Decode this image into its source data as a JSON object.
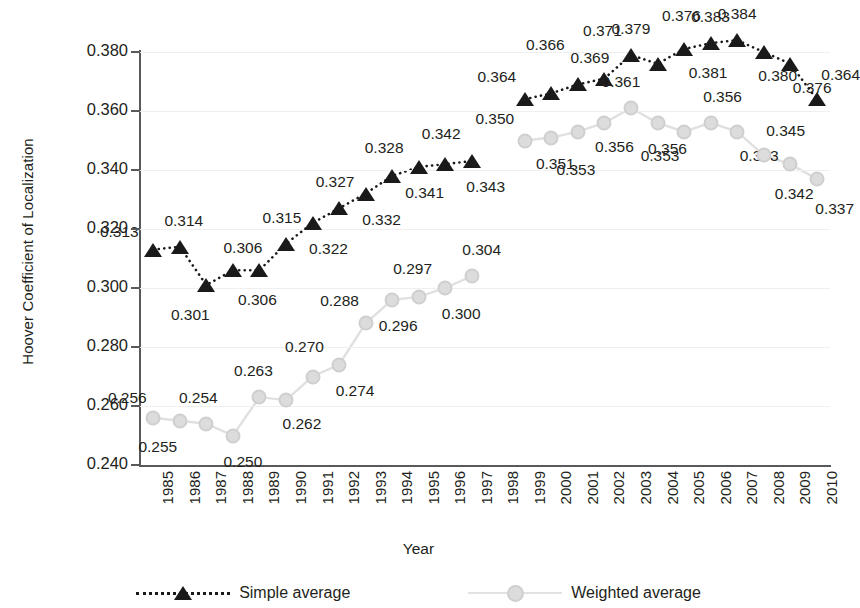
{
  "chart_data": {
    "type": "line",
    "title": "",
    "xlabel": "Year",
    "ylabel": "Hoover Coefficient of Localization",
    "ylim": [
      0.24,
      0.38
    ],
    "ytick_labels": [
      "0.380",
      "0.360",
      "0.340",
      "0.320",
      "0.300",
      "0.280",
      "0.260",
      "0.240"
    ],
    "ytick_values": [
      0.38,
      0.36,
      0.34,
      0.32,
      0.3,
      0.28,
      0.26,
      0.24
    ],
    "grid": true,
    "legend_position": "bottom",
    "categories": [
      "1985",
      "1986",
      "1987",
      "1988",
      "1989",
      "1990",
      "1991",
      "1992",
      "1993",
      "1994",
      "1995",
      "1996",
      "1997",
      "1998",
      "1999",
      "2000",
      "2001",
      "2002",
      "2003",
      "2004",
      "2005",
      "2006",
      "2007",
      "2008",
      "2009",
      "2010"
    ],
    "series": [
      {
        "name": "Simple average",
        "color": "#1a1a1a",
        "marker": "triangle",
        "linestyle": "dotted",
        "values": [
          0.313,
          0.314,
          0.301,
          0.306,
          0.306,
          0.315,
          0.322,
          0.327,
          0.332,
          0.338,
          0.341,
          0.342,
          0.343,
          null,
          0.364,
          0.366,
          0.369,
          0.371,
          0.379,
          0.376,
          0.381,
          0.383,
          0.384,
          0.38,
          0.376,
          0.364
        ],
        "point_labels": [
          "0.313",
          "0.314",
          "0.301",
          "0.306",
          "0.306",
          "0.315",
          "0.322",
          "0.327",
          "0.332",
          "0.328",
          "0.341",
          "0.342",
          "0.343",
          null,
          "0.364",
          "0.366",
          "0.369",
          "0.371",
          "0.379",
          "0.376",
          "0.381",
          "0.383",
          "0.384",
          "0.380",
          "0.376",
          "0.364"
        ]
      },
      {
        "name": "Weighted average",
        "color": "#d9d9d9",
        "marker": "circle",
        "linestyle": "solid",
        "values": [
          0.256,
          0.255,
          0.254,
          0.25,
          0.263,
          0.262,
          0.27,
          0.274,
          0.288,
          0.296,
          0.297,
          0.3,
          0.304,
          null,
          0.35,
          0.351,
          0.353,
          0.356,
          0.361,
          0.356,
          0.353,
          0.356,
          0.353,
          0.345,
          0.342,
          0.337
        ],
        "point_labels": [
          "0.256",
          "0.255",
          "0.254",
          "0.250",
          "0.263",
          "0.262",
          "0.270",
          "0.274",
          "0.288",
          "0.296",
          "0.297",
          "0.300",
          "0.304",
          null,
          "0.350",
          "0.351",
          "0.353",
          "0.356",
          "0.361",
          "0.356",
          "0.353",
          "0.356",
          "0.353",
          "0.345",
          "0.342",
          "0.337"
        ]
      }
    ]
  },
  "legend": {
    "simple_label": "Simple average",
    "weighted_label": "Weighted average"
  }
}
